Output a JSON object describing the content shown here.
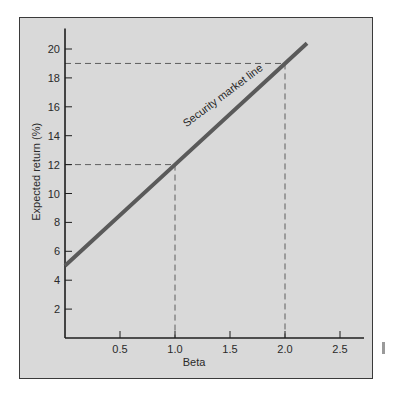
{
  "chart_data": {
    "type": "line",
    "title": "",
    "xlabel": "Beta",
    "ylabel": "Expected return (%)",
    "xlim": [
      0,
      2.7
    ],
    "ylim": [
      0,
      21
    ],
    "x_ticks": [
      "0.5",
      "1.0",
      "1.5",
      "2.0",
      "2.5"
    ],
    "x_tick_values": [
      0.5,
      1.0,
      1.5,
      2.0,
      2.5
    ],
    "y_ticks": [
      "2",
      "4",
      "6",
      "8",
      "10",
      "12",
      "14",
      "16",
      "18",
      "20"
    ],
    "y_tick_values": [
      2,
      4,
      6,
      8,
      10,
      12,
      14,
      16,
      18,
      20
    ],
    "grid": false,
    "legend": null,
    "series": [
      {
        "name": "Security market line",
        "x": [
          0,
          1.0,
          2.0,
          2.2
        ],
        "y": [
          5,
          12,
          19,
          20.4
        ],
        "color": "#5a5a5a"
      }
    ],
    "annotations": [
      {
        "type": "text",
        "text": "Security market line",
        "x": 1.45,
        "y": 15.4,
        "rotation": -37
      },
      {
        "type": "dashed-guide",
        "x": 1.0,
        "y": 12
      },
      {
        "type": "dashed-guide",
        "x": 2.0,
        "y": 19
      }
    ],
    "colors": {
      "background": "#d9d9d9",
      "frame": "#3a3a3a",
      "axis": "#1e1e1e",
      "line": "#5a5a5a",
      "dashed": "#5e5e5e"
    }
  }
}
